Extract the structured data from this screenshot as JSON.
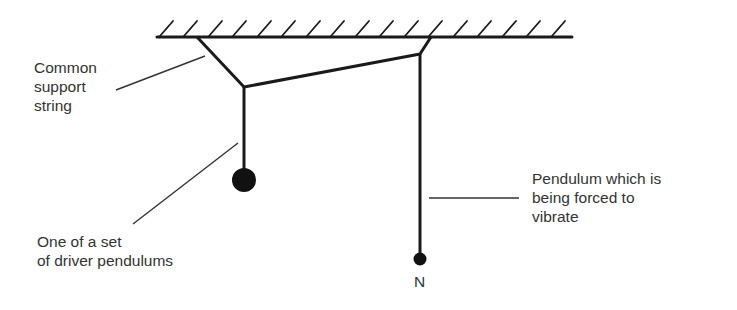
{
  "diagram": {
    "labels": {
      "support_string": [
        "Common",
        "support",
        "string"
      ],
      "driver": [
        "One of a set",
        "of driver pendulums"
      ],
      "forced": [
        "Pendulum which is",
        "being forced to",
        "vibrate"
      ],
      "n_marker": "N"
    },
    "colors": {
      "ink": "#1a1a1a",
      "text": "#333333",
      "background": "#ffffff"
    }
  }
}
